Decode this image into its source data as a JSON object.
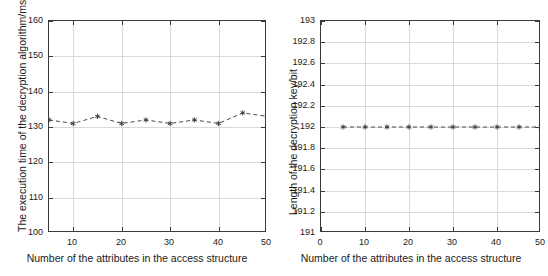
{
  "figure": {
    "background": "#ffffff",
    "line_color": "#4a4a4a",
    "grid_color": "#d9d9d9",
    "axis_color": "#3a3a3a"
  },
  "chart_data": [
    {
      "id": "left",
      "type": "line",
      "title": "",
      "xlabel": "Number of the attributes in the access structure",
      "ylabel": "The execution time of the decryption algorithm/ms",
      "xlim": [
        5,
        50
      ],
      "ylim": [
        100,
        160
      ],
      "xticks": [
        10,
        20,
        30,
        40,
        50
      ],
      "xticklabels": [
        "10",
        "20",
        "30",
        "40",
        "50"
      ],
      "yticks": [
        100,
        110,
        120,
        130,
        140,
        150,
        160
      ],
      "yticklabels": [
        "100",
        "110",
        "120",
        "130",
        "140",
        "150",
        "160"
      ],
      "grid": true,
      "legend": "none",
      "linestyle": "dashed",
      "marker": "asterisk",
      "x": [
        5,
        10,
        15,
        20,
        25,
        30,
        35,
        40,
        45,
        50
      ],
      "values": [
        132,
        131,
        133,
        131,
        132,
        131,
        132,
        131,
        134,
        133
      ]
    },
    {
      "id": "right",
      "type": "line",
      "title": "",
      "xlabel": "Number of the attributes in the access structure",
      "ylabel": "Length of the decryption key/bit",
      "xlim": [
        0,
        50
      ],
      "ylim": [
        191,
        193
      ],
      "xticks": [
        0,
        10,
        20,
        30,
        40,
        50
      ],
      "xticklabels": [
        "0",
        "10",
        "20",
        "30",
        "40",
        "50"
      ],
      "yticks": [
        191,
        191.2,
        191.4,
        191.6,
        191.8,
        192,
        192.2,
        192.4,
        192.6,
        192.8,
        193
      ],
      "yticklabels": [
        "191",
        "191.2",
        "191.4",
        "191.6",
        "191.8",
        "192",
        "192.2",
        "192.4",
        "192.6",
        "192.8",
        "193"
      ],
      "grid": true,
      "legend": "none",
      "linestyle": "dashed",
      "marker": "asterisk",
      "x": [
        5,
        10,
        15,
        20,
        25,
        30,
        35,
        40,
        45,
        50
      ],
      "values": [
        192,
        192,
        192,
        192,
        192,
        192,
        192,
        192,
        192,
        192
      ]
    }
  ]
}
